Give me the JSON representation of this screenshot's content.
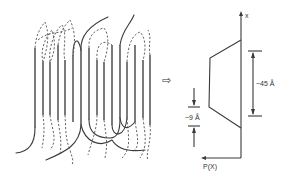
{
  "figure": {
    "left_panel": {
      "name": "chain-folding-model",
      "stem_count": 16,
      "legend": {
        "solid": "adjacent re-entry / tie chains",
        "dashed": "random re-entry loops"
      }
    },
    "transition_symbol": "⇨",
    "right_panel": {
      "name": "density-profile",
      "y_axis_label": "x",
      "x_axis_label": "P(X)",
      "crystal_thickness_label": "~45 Å",
      "interface_thickness_label": "~9 Å"
    }
  }
}
